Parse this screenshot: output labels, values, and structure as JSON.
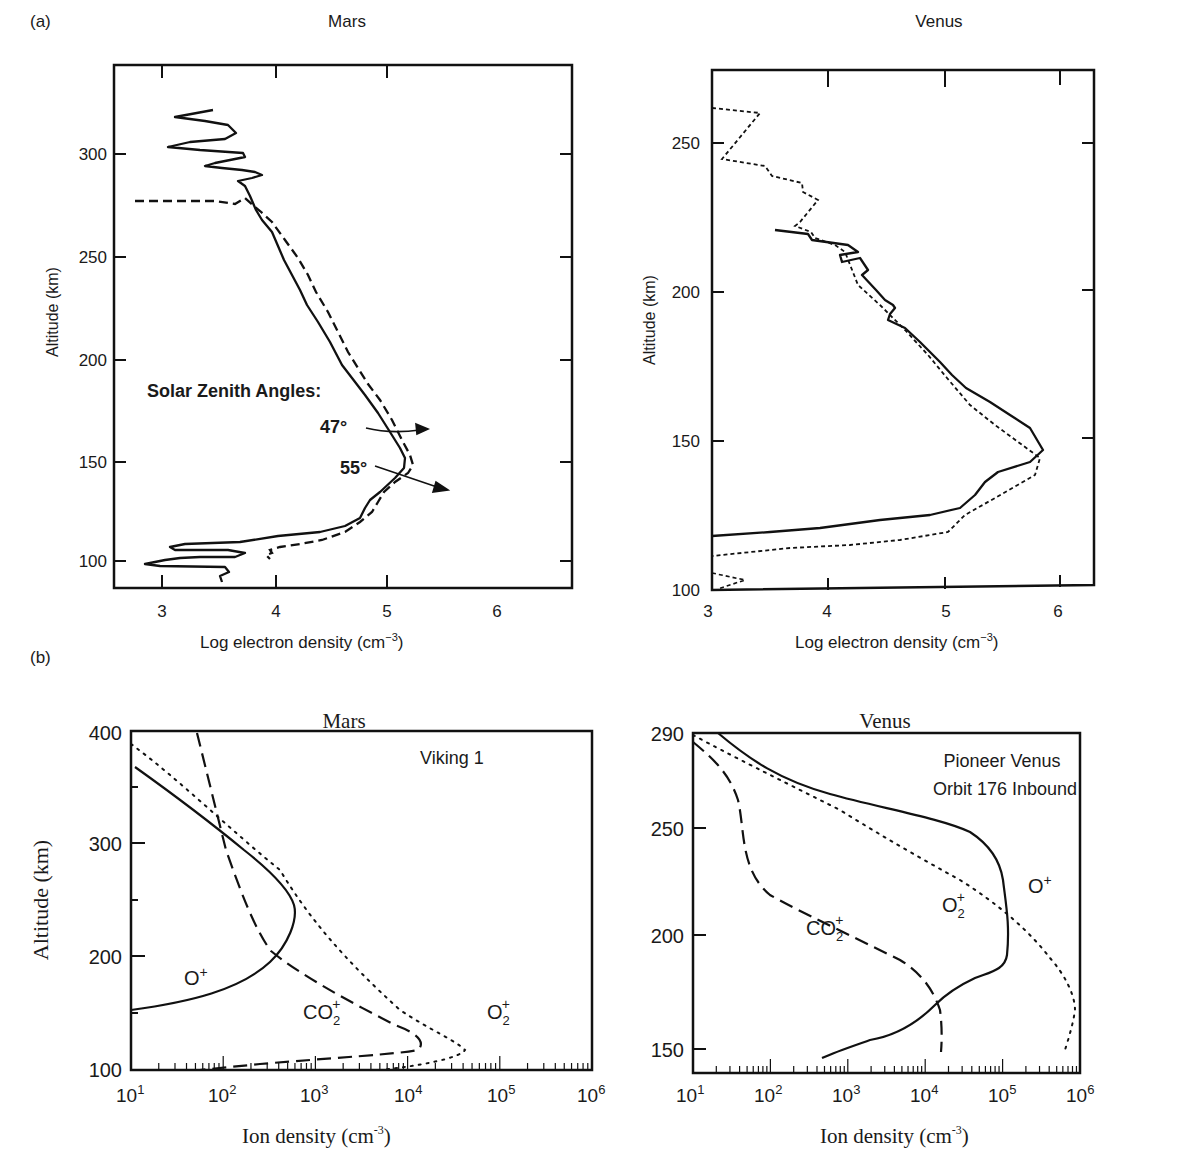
{
  "figure": {
    "panel_a_label": "(a)",
    "panel_b_label": "(b)"
  },
  "chart_data": [
    {
      "id": "a_mars",
      "type": "line",
      "title": "Mars",
      "xlabel": "Log electron density (cm⁻³)",
      "ylabel": "Altitude (km)",
      "xlim": [
        2.55,
        6.0
      ],
      "ylim": [
        87,
        330
      ],
      "xticks": [
        3,
        4,
        5,
        6
      ],
      "yticks": [
        100,
        150,
        200,
        250,
        300
      ],
      "annotations": [
        "Solar Zenith Angles:",
        "47°",
        "55°"
      ],
      "series": [
        {
          "name": "47° (solid)",
          "style": "solid",
          "points": [
            [
              3.5,
              321
            ],
            [
              3.18,
              317
            ],
            [
              3.65,
              312
            ],
            [
              3.3,
              306
            ],
            [
              3.7,
              301
            ],
            [
              3.45,
              297
            ],
            [
              3.82,
              292
            ],
            [
              3.7,
              289
            ],
            [
              3.95,
              265
            ],
            [
              4.2,
              250
            ],
            [
              4.4,
              230
            ],
            [
              4.65,
              200
            ],
            [
              4.85,
              175
            ],
            [
              5.15,
              150
            ],
            [
              5.05,
              140
            ],
            [
              4.85,
              130
            ],
            [
              4.8,
              120
            ],
            [
              4.6,
              110
            ],
            [
              4.3,
              105
            ],
            [
              3.8,
              101
            ],
            [
              3.0,
              98
            ],
            [
              2.8,
              95
            ],
            [
              3.5,
              93
            ],
            [
              3.45,
              88
            ]
          ]
        },
        {
          "name": "55° (dashed)",
          "style": "dashed",
          "points": [
            [
              2.8,
              275
            ],
            [
              3.5,
              275
            ],
            [
              3.65,
              277
            ],
            [
              3.75,
              271
            ],
            [
              3.85,
              268
            ],
            [
              4.1,
              255
            ],
            [
              4.3,
              240
            ],
            [
              4.55,
              210
            ],
            [
              4.75,
              185
            ],
            [
              4.95,
              165
            ],
            [
              5.2,
              145
            ],
            [
              5.25,
              140
            ],
            [
              5.0,
              130
            ],
            [
              4.9,
              120
            ],
            [
              4.8,
              110
            ],
            [
              4.5,
              100
            ],
            [
              4.0,
              95
            ],
            [
              3.9,
              90
            ]
          ]
        }
      ]
    },
    {
      "id": "a_venus",
      "type": "line",
      "title": "Venus",
      "xlabel": "Log electron density (cm⁻³)",
      "ylabel": "Altitude (km)",
      "xlim": [
        3.0,
        6.3
      ],
      "ylim": [
        100,
        275
      ],
      "xticks": [
        3,
        4,
        5,
        6
      ],
      "yticks": [
        100,
        150,
        200,
        250
      ],
      "series": [
        {
          "name": "solid",
          "style": "solid",
          "points": [
            [
              3.45,
              222
            ],
            [
              3.8,
              219
            ],
            [
              4.05,
              215
            ],
            [
              3.9,
              210
            ],
            [
              4.2,
              207
            ],
            [
              4.3,
              200
            ],
            [
              4.45,
              193
            ],
            [
              4.3,
              189
            ],
            [
              4.55,
              180
            ],
            [
              4.8,
              170
            ],
            [
              5.1,
              157
            ],
            [
              5.4,
              143
            ],
            [
              5.35,
              138
            ],
            [
              5.0,
              130
            ],
            [
              4.9,
              124
            ],
            [
              4.2,
              119
            ],
            [
              3.0,
              115
            ]
          ]
        },
        {
          "name": "dashed",
          "style": "dotted",
          "points": [
            [
              3.0,
              262
            ],
            [
              3.4,
              260
            ],
            [
              3.1,
              244
            ],
            [
              3.5,
              240
            ],
            [
              3.75,
              234
            ],
            [
              3.9,
              229
            ],
            [
              3.65,
              221
            ],
            [
              3.8,
              216
            ],
            [
              4.05,
              212
            ],
            [
              4.3,
              200
            ],
            [
              4.5,
              190
            ],
            [
              4.8,
              170
            ],
            [
              5.1,
              157
            ],
            [
              5.4,
              143
            ],
            [
              5.0,
              130
            ],
            [
              4.9,
              124
            ],
            [
              4.2,
              119
            ],
            [
              3.0,
              115
            ]
          ]
        }
      ]
    },
    {
      "id": "b_mars",
      "type": "line",
      "title": "Mars",
      "subtitle": "Viking 1",
      "xlabel": "Ion density (cm⁻³)",
      "ylabel": "Altitude (km)",
      "xscale": "log",
      "xlim": [
        10,
        1000000
      ],
      "ylim": [
        100,
        400
      ],
      "xticks": [
        "10¹",
        "10²",
        "10³",
        "10⁴",
        "10⁵",
        "10⁶"
      ],
      "yticks": [
        100,
        200,
        300,
        400
      ],
      "series": [
        {
          "name": "O⁺",
          "style": "solid",
          "points": [
            [
              11,
              368
            ],
            [
              40,
              340
            ],
            [
              150,
              305
            ],
            [
              400,
              270
            ],
            [
              650,
              240
            ],
            [
              600,
              215
            ],
            [
              350,
              190
            ],
            [
              100,
              168
            ],
            [
              10,
              152
            ]
          ]
        },
        {
          "name": "CO₂⁺",
          "style": "dashed",
          "points": [
            [
              50,
              400
            ],
            [
              150,
              300
            ],
            [
              250,
              250
            ],
            [
              600,
              205
            ],
            [
              3000,
              170
            ],
            [
              10000,
              145
            ],
            [
              14000,
              135
            ],
            [
              10000,
              123
            ],
            [
              1000,
              115
            ],
            [
              80,
              103
            ]
          ]
        },
        {
          "name": "O₂⁺",
          "style": "dotted",
          "points": [
            [
              10,
              392
            ],
            [
              100,
              340
            ],
            [
              500,
              290
            ],
            [
              1500,
              240
            ],
            [
              8000,
              190
            ],
            [
              40000,
              150
            ],
            [
              80000,
              125
            ],
            [
              50000,
              115
            ],
            [
              10000,
              102
            ]
          ]
        }
      ]
    },
    {
      "id": "b_venus",
      "type": "line",
      "title": "Venus",
      "subtitle": "Pioneer Venus Orbit 176 Inbound",
      "xlabel": "Ion density (cm⁻³)",
      "ylabel": "Altitude (km)",
      "xscale": "log",
      "xlim": [
        10,
        1000000
      ],
      "ylim": [
        140,
        290
      ],
      "xticks": [
        "10¹",
        "10²",
        "10³",
        "10⁴",
        "10⁵",
        "10⁶"
      ],
      "yticks": [
        150,
        200,
        250,
        290
      ],
      "series": [
        {
          "name": "O⁺",
          "style": "solid",
          "points": [
            [
              18,
              290
            ],
            [
              100,
              272
            ],
            [
              1000,
              260
            ],
            [
              10000,
              253
            ],
            [
              40000,
              248
            ],
            [
              65000,
              235
            ],
            [
              75000,
              215
            ],
            [
              80000,
              198
            ],
            [
              65000,
              185
            ],
            [
              25000,
              178
            ],
            [
              10000,
              163
            ],
            [
              1300,
              148
            ]
          ]
        },
        {
          "name": "CO₂⁺",
          "style": "dashed",
          "points": [
            [
              10,
              262
            ],
            [
              25,
              245
            ],
            [
              40,
              225
            ],
            [
              60,
              210
            ],
            [
              300,
              197
            ],
            [
              3000,
              180
            ],
            [
              8000,
              168
            ],
            [
              9500,
              158
            ],
            [
              9500,
              148
            ]
          ]
        },
        {
          "name": "O₂⁺",
          "style": "dotted",
          "points": [
            [
              10,
              268
            ],
            [
              100,
              250
            ],
            [
              1000,
              232
            ],
            [
              10000,
              213
            ],
            [
              80000,
              190
            ],
            [
              200000,
              178
            ],
            [
              300000,
              167
            ],
            [
              250000,
              158
            ],
            [
              220000,
              148
            ]
          ]
        }
      ]
    }
  ],
  "labels": {
    "a_mars_title": "Mars",
    "a_venus_title": "Venus",
    "b_mars_title": "Mars",
    "b_venus_title": "Venus",
    "altitude_km": "Altitude (km)",
    "log_electron_density": "Log electron density (cm",
    "ion_density": "Ion density (cm",
    "exp_neg3": "−3",
    "exp_neg3_serif": "-3",
    "solar_zenith": "Solar Zenith Angles:",
    "sza_47": "47°",
    "sza_55": "55°",
    "viking": "Viking 1",
    "pioneer_1": "Pioneer Venus",
    "pioneer_2": "Orbit 176 Inbound",
    "o_plus": "O",
    "o2_plus": "O",
    "co2_plus": "CO",
    "sub2": "2",
    "plus": "+",
    "a_mars_yticks": [
      "300",
      "250",
      "200",
      "150",
      "100"
    ],
    "a_mars_xticks": [
      "3",
      "4",
      "5",
      "6"
    ],
    "a_venus_yticks": [
      "250",
      "200",
      "150",
      "100"
    ],
    "a_venus_xticks": [
      "3",
      "4",
      "5",
      "6"
    ],
    "b_mars_yticks": [
      "400",
      "300",
      "200",
      "100"
    ],
    "b_venus_yticks": [
      "290",
      "250",
      "200",
      "150"
    ],
    "decade_base": "10",
    "decade_exps": [
      "1",
      "2",
      "3",
      "4",
      "5",
      "6"
    ]
  }
}
